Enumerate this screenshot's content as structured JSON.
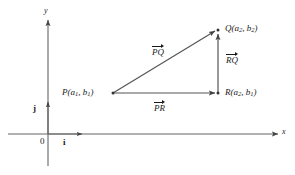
{
  "figure": {
    "background_color": "#ffffff",
    "line_color": "#555555",
    "text_color": "#1a1a1a",
    "width": 295,
    "height": 175
  },
  "axes": {
    "x_label": "x",
    "y_label": "y",
    "origin_label": "0",
    "origin": {
      "x": 48,
      "y": 134
    },
    "x_axis": {
      "x1": 8,
      "y1": 134,
      "x2": 282,
      "y2": 134
    },
    "y_axis": {
      "x1": 48,
      "y1": 166,
      "x2": 48,
      "y2": 16
    }
  },
  "unit_vectors": [
    {
      "name": "i",
      "label": "i",
      "direction": "horizontal",
      "from": {
        "x": 48,
        "y": 134
      },
      "to": {
        "x": 85,
        "y": 134
      },
      "label_pos": {
        "x": 63,
        "y": 139
      }
    },
    {
      "name": "j",
      "label": "j",
      "direction": "vertical",
      "from": {
        "x": 48,
        "y": 134
      },
      "to": {
        "x": 48,
        "y": 100
      },
      "label_pos": {
        "x": 33,
        "y": 106
      }
    }
  ],
  "points": [
    {
      "id": "P",
      "label": "P(a<sub>1</sub>, b<sub>1</sub>)",
      "plain_label": "P(a1, b1)",
      "x": 113,
      "y": 93,
      "label_anchor": "right"
    },
    {
      "id": "Q",
      "label": "Q(a<sub>2</sub>, b<sub>2</sub>)",
      "plain_label": "Q(a2, b2)",
      "x": 218,
      "y": 30,
      "label_anchor": "left"
    },
    {
      "id": "R",
      "label": "R(a<sub>2</sub>, b<sub>1</sub>)",
      "plain_label": "R(a2, b1)",
      "x": 218,
      "y": 93,
      "label_anchor": "left"
    }
  ],
  "vectors": [
    {
      "id": "PQ",
      "label": "PQ",
      "from": "P",
      "to": "Q",
      "label_pos": {
        "x": 152,
        "y": 45
      }
    },
    {
      "id": "PR",
      "label": "PR",
      "from": "P",
      "to": "R",
      "label_pos": {
        "x": 154,
        "y": 101
      }
    },
    {
      "id": "RQ",
      "label": "RQ",
      "from": "R",
      "to": "Q",
      "label_pos": {
        "x": 226,
        "y": 53
      }
    }
  ]
}
